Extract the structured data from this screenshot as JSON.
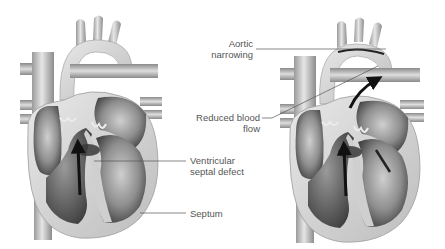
{
  "diagram": {
    "type": "medical-illustration",
    "panels": [
      {
        "id": "left-heart",
        "description": "Heart with ventricular septal defect"
      },
      {
        "id": "right-heart",
        "description": "Heart with aortic narrowing and reduced blood flow"
      }
    ],
    "labels": {
      "aortic_line1": "Aortic",
      "aortic_line2": "narrowing",
      "reduced_line1": "Reduced blood",
      "reduced_line2": "flow",
      "vsd_line1": "Ventricular",
      "vsd_line2": "septal defect",
      "septum": "Septum"
    },
    "colors": {
      "background": "#ffffff",
      "tissue_light": "#d9d9d9",
      "tissue_mid": "#a8a8a8",
      "tissue_dark": "#4a4a4a",
      "arrow": "#111111",
      "label_text": "#555555",
      "leader_line": "#555555"
    }
  }
}
